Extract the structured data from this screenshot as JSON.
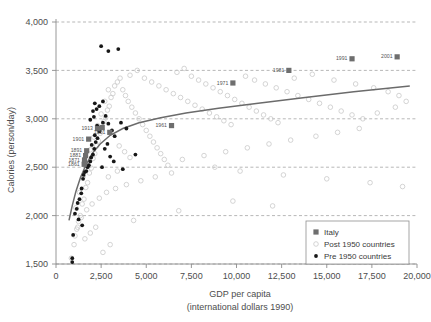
{
  "chart_data": {
    "type": "scatter",
    "title": "",
    "xlabel": "GDP per capita",
    "xlabel_sub": "(international dollars 1990)",
    "ylabel": "Calories (person/day)",
    "xlim": [
      0,
      20000
    ],
    "ylim": [
      1500,
      4000
    ],
    "xticks": [
      0,
      2500,
      5000,
      7500,
      10000,
      12500,
      15000,
      17500,
      20000
    ],
    "xtick_labels": [
      "0",
      "2,500",
      "5,000",
      "7,500",
      "10,000",
      "12,500",
      "15,000",
      "17,500",
      "20,000"
    ],
    "yticks": [
      1500,
      2000,
      2500,
      3000,
      3500,
      4000
    ],
    "ytick_labels": [
      "1,500",
      "2,000",
      "2,500",
      "3,000",
      "3,500",
      "4,000"
    ],
    "grid": true,
    "legend_position": "bottom-right",
    "legend": [
      {
        "label": "Italy",
        "marker": "square",
        "color": "#6e6e6e"
      },
      {
        "label": "Post 1950 countries",
        "marker": "circle-open",
        "color": "#c9c9c9"
      },
      {
        "label": "Pre 1950 countries",
        "marker": "dot",
        "color": "#171717"
      }
    ],
    "series": [
      {
        "name": "Italy",
        "marker": "square",
        "color": "#6e6e6e",
        "points": [
          {
            "x": 1560,
            "y": 2530,
            "label": "1861"
          },
          {
            "x": 1580,
            "y": 2575,
            "label": "1871"
          },
          {
            "x": 1640,
            "y": 2620,
            "label": "1881"
          },
          {
            "x": 1700,
            "y": 2670,
            "label": "1891"
          },
          {
            "x": 1810,
            "y": 2790,
            "label": "1901"
          },
          {
            "x": 2300,
            "y": 2900,
            "label": "1913"
          },
          {
            "x": 2560,
            "y": 2910,
            "label": ""
          },
          {
            "x": 2980,
            "y": 2860,
            "label": "1951"
          },
          {
            "x": 6400,
            "y": 2930,
            "label": "1961"
          },
          {
            "x": 9800,
            "y": 3370,
            "label": "1971"
          },
          {
            "x": 12900,
            "y": 3500,
            "label": "1981"
          },
          {
            "x": 16400,
            "y": 3620,
            "label": "1991"
          },
          {
            "x": 18900,
            "y": 3640,
            "label": "2001"
          }
        ]
      },
      {
        "name": "Pre 1950 countries",
        "marker": "dot",
        "color": "#171717",
        "points": [
          {
            "x": 900,
            "y": 1520
          },
          {
            "x": 900,
            "y": 1560
          },
          {
            "x": 950,
            "y": 1800
          },
          {
            "x": 1050,
            "y": 2020
          },
          {
            "x": 1150,
            "y": 2070
          },
          {
            "x": 1200,
            "y": 2130
          },
          {
            "x": 1300,
            "y": 2170
          },
          {
            "x": 1400,
            "y": 2230
          },
          {
            "x": 1420,
            "y": 2280
          },
          {
            "x": 1500,
            "y": 2380
          },
          {
            "x": 1530,
            "y": 2420
          },
          {
            "x": 1600,
            "y": 2450
          },
          {
            "x": 1680,
            "y": 2460
          },
          {
            "x": 1750,
            "y": 2500
          },
          {
            "x": 1820,
            "y": 2520
          },
          {
            "x": 1900,
            "y": 2560
          },
          {
            "x": 1950,
            "y": 2600
          },
          {
            "x": 2050,
            "y": 2630
          },
          {
            "x": 2120,
            "y": 2690
          },
          {
            "x": 1980,
            "y": 2730
          },
          {
            "x": 2200,
            "y": 2760
          },
          {
            "x": 2300,
            "y": 2800
          },
          {
            "x": 2150,
            "y": 2830
          },
          {
            "x": 2400,
            "y": 2870
          },
          {
            "x": 2500,
            "y": 2900
          },
          {
            "x": 2280,
            "y": 2930
          },
          {
            "x": 2600,
            "y": 2960
          },
          {
            "x": 1900,
            "y": 2990
          },
          {
            "x": 2100,
            "y": 3020
          },
          {
            "x": 2050,
            "y": 3080
          },
          {
            "x": 2250,
            "y": 3100
          },
          {
            "x": 2400,
            "y": 3130
          },
          {
            "x": 2150,
            "y": 3160
          },
          {
            "x": 2600,
            "y": 3180
          },
          {
            "x": 2750,
            "y": 3030
          },
          {
            "x": 2900,
            "y": 2950
          },
          {
            "x": 3100,
            "y": 2880
          },
          {
            "x": 3250,
            "y": 2820
          },
          {
            "x": 2850,
            "y": 2740
          },
          {
            "x": 2700,
            "y": 2690
          },
          {
            "x": 3000,
            "y": 2610
          },
          {
            "x": 3200,
            "y": 2560
          },
          {
            "x": 2550,
            "y": 2500
          },
          {
            "x": 2500,
            "y": 3750
          },
          {
            "x": 2900,
            "y": 3700
          },
          {
            "x": 3450,
            "y": 3720
          },
          {
            "x": 3600,
            "y": 2960
          },
          {
            "x": 3900,
            "y": 2900
          },
          {
            "x": 4400,
            "y": 2630
          },
          {
            "x": 1450,
            "y": 1900
          },
          {
            "x": 1250,
            "y": 1960
          },
          {
            "x": 3700,
            "y": 2480
          }
        ]
      },
      {
        "name": "Post 1950 countries",
        "marker": "circle-open",
        "color": "#c9c9c9",
        "points": [
          {
            "x": 850,
            "y": 1560
          },
          {
            "x": 1000,
            "y": 1700
          },
          {
            "x": 1050,
            "y": 1790
          },
          {
            "x": 1150,
            "y": 1860
          },
          {
            "x": 1250,
            "y": 1940
          },
          {
            "x": 1350,
            "y": 2000
          },
          {
            "x": 1100,
            "y": 2080
          },
          {
            "x": 1450,
            "y": 2120
          },
          {
            "x": 1550,
            "y": 2170
          },
          {
            "x": 1300,
            "y": 2240
          },
          {
            "x": 1650,
            "y": 2290
          },
          {
            "x": 1750,
            "y": 2340
          },
          {
            "x": 1500,
            "y": 2400
          },
          {
            "x": 1850,
            "y": 2440
          },
          {
            "x": 1950,
            "y": 2490
          },
          {
            "x": 1700,
            "y": 2540
          },
          {
            "x": 2050,
            "y": 2590
          },
          {
            "x": 2150,
            "y": 2640
          },
          {
            "x": 1900,
            "y": 2680
          },
          {
            "x": 2250,
            "y": 2720
          },
          {
            "x": 2350,
            "y": 2770
          },
          {
            "x": 2100,
            "y": 2810
          },
          {
            "x": 2450,
            "y": 2850
          },
          {
            "x": 2550,
            "y": 2890
          },
          {
            "x": 2300,
            "y": 2930
          },
          {
            "x": 2650,
            "y": 2970
          },
          {
            "x": 2750,
            "y": 3010
          },
          {
            "x": 2500,
            "y": 3050
          },
          {
            "x": 2850,
            "y": 3090
          },
          {
            "x": 2950,
            "y": 3130
          },
          {
            "x": 2700,
            "y": 3180
          },
          {
            "x": 3050,
            "y": 3220
          },
          {
            "x": 3150,
            "y": 3260
          },
          {
            "x": 2900,
            "y": 3300
          },
          {
            "x": 3250,
            "y": 3340
          },
          {
            "x": 3400,
            "y": 3380
          },
          {
            "x": 3550,
            "y": 3420
          },
          {
            "x": 3700,
            "y": 3300
          },
          {
            "x": 3850,
            "y": 3240
          },
          {
            "x": 4000,
            "y": 3180
          },
          {
            "x": 4200,
            "y": 3120
          },
          {
            "x": 4400,
            "y": 3060
          },
          {
            "x": 4600,
            "y": 3000
          },
          {
            "x": 4800,
            "y": 2940
          },
          {
            "x": 5000,
            "y": 2880
          },
          {
            "x": 5200,
            "y": 2820
          },
          {
            "x": 5400,
            "y": 2760
          },
          {
            "x": 5600,
            "y": 2700
          },
          {
            "x": 5800,
            "y": 2640
          },
          {
            "x": 6000,
            "y": 2580
          },
          {
            "x": 6200,
            "y": 2520
          },
          {
            "x": 4100,
            "y": 3450
          },
          {
            "x": 4500,
            "y": 3500
          },
          {
            "x": 4900,
            "y": 3420
          },
          {
            "x": 5300,
            "y": 3380
          },
          {
            "x": 5700,
            "y": 3340
          },
          {
            "x": 6100,
            "y": 3300
          },
          {
            "x": 6500,
            "y": 3260
          },
          {
            "x": 6900,
            "y": 3220
          },
          {
            "x": 7300,
            "y": 3180
          },
          {
            "x": 7700,
            "y": 3140
          },
          {
            "x": 8100,
            "y": 3100
          },
          {
            "x": 8500,
            "y": 3060
          },
          {
            "x": 8900,
            "y": 3020
          },
          {
            "x": 9300,
            "y": 2980
          },
          {
            "x": 9700,
            "y": 2940
          },
          {
            "x": 6700,
            "y": 3480
          },
          {
            "x": 7100,
            "y": 3520
          },
          {
            "x": 7500,
            "y": 3440
          },
          {
            "x": 7900,
            "y": 3400
          },
          {
            "x": 8300,
            "y": 3360
          },
          {
            "x": 8700,
            "y": 3320
          },
          {
            "x": 9100,
            "y": 3280
          },
          {
            "x": 9500,
            "y": 3240
          },
          {
            "x": 9900,
            "y": 3200
          },
          {
            "x": 10300,
            "y": 3160
          },
          {
            "x": 10700,
            "y": 3120
          },
          {
            "x": 11100,
            "y": 3080
          },
          {
            "x": 11500,
            "y": 3040
          },
          {
            "x": 11900,
            "y": 3000
          },
          {
            "x": 12300,
            "y": 2960
          },
          {
            "x": 10500,
            "y": 3440
          },
          {
            "x": 11000,
            "y": 3400
          },
          {
            "x": 11600,
            "y": 3360
          },
          {
            "x": 12200,
            "y": 3320
          },
          {
            "x": 12800,
            "y": 3280
          },
          {
            "x": 13400,
            "y": 3240
          },
          {
            "x": 14000,
            "y": 3200
          },
          {
            "x": 14600,
            "y": 3160
          },
          {
            "x": 15200,
            "y": 3120
          },
          {
            "x": 15800,
            "y": 3080
          },
          {
            "x": 16400,
            "y": 3040
          },
          {
            "x": 17000,
            "y": 3000
          },
          {
            "x": 13200,
            "y": 3420
          },
          {
            "x": 14200,
            "y": 3460
          },
          {
            "x": 15400,
            "y": 3400
          },
          {
            "x": 16600,
            "y": 3360
          },
          {
            "x": 17600,
            "y": 3320
          },
          {
            "x": 18400,
            "y": 3280
          },
          {
            "x": 19000,
            "y": 3240
          },
          {
            "x": 19400,
            "y": 3180
          },
          {
            "x": 18800,
            "y": 3120
          },
          {
            "x": 17800,
            "y": 3060
          },
          {
            "x": 16800,
            "y": 2900
          },
          {
            "x": 15600,
            "y": 2860
          },
          {
            "x": 14400,
            "y": 2820
          },
          {
            "x": 13000,
            "y": 2780
          },
          {
            "x": 11800,
            "y": 2740
          },
          {
            "x": 10600,
            "y": 2700
          },
          {
            "x": 9400,
            "y": 2660
          },
          {
            "x": 8200,
            "y": 2620
          },
          {
            "x": 7000,
            "y": 2580
          },
          {
            "x": 6400,
            "y": 2440
          },
          {
            "x": 5500,
            "y": 2400
          },
          {
            "x": 4700,
            "y": 2360
          },
          {
            "x": 3900,
            "y": 2320
          },
          {
            "x": 3300,
            "y": 2280
          },
          {
            "x": 2800,
            "y": 2240
          },
          {
            "x": 2400,
            "y": 2180
          },
          {
            "x": 2000,
            "y": 2120
          },
          {
            "x": 1700,
            "y": 2060
          },
          {
            "x": 1400,
            "y": 1980
          },
          {
            "x": 1200,
            "y": 1880
          },
          {
            "x": 1600,
            "y": 1760
          },
          {
            "x": 1900,
            "y": 1820
          },
          {
            "x": 2200,
            "y": 1880
          },
          {
            "x": 8800,
            "y": 2500
          },
          {
            "x": 10200,
            "y": 2460
          },
          {
            "x": 12600,
            "y": 2420
          },
          {
            "x": 15000,
            "y": 2380
          },
          {
            "x": 17400,
            "y": 2340
          },
          {
            "x": 19200,
            "y": 2300
          },
          {
            "x": 9800,
            "y": 2150
          },
          {
            "x": 12000,
            "y": 2100
          },
          {
            "x": 6800,
            "y": 2050
          },
          {
            "x": 4300,
            "y": 1950
          },
          {
            "x": 3000,
            "y": 1700
          },
          {
            "x": 2600,
            "y": 1620
          },
          {
            "x": 3500,
            "y": 2720
          },
          {
            "x": 3800,
            "y": 2660
          },
          {
            "x": 4100,
            "y": 2600
          },
          {
            "x": 2900,
            "y": 2400
          },
          {
            "x": 3400,
            "y": 2460
          }
        ]
      }
    ],
    "trend_line": {
      "name": "fitted trend",
      "points": [
        {
          "x": 720,
          "y": 1950
        },
        {
          "x": 900,
          "y": 2100
        },
        {
          "x": 1100,
          "y": 2250
        },
        {
          "x": 1350,
          "y": 2390
        },
        {
          "x": 1650,
          "y": 2520
        },
        {
          "x": 2000,
          "y": 2640
        },
        {
          "x": 2450,
          "y": 2740
        },
        {
          "x": 3000,
          "y": 2830
        },
        {
          "x": 3700,
          "y": 2900
        },
        {
          "x": 4600,
          "y": 2960
        },
        {
          "x": 5800,
          "y": 3010
        },
        {
          "x": 7200,
          "y": 3060
        },
        {
          "x": 9000,
          "y": 3110
        },
        {
          "x": 11200,
          "y": 3160
        },
        {
          "x": 13800,
          "y": 3220
        },
        {
          "x": 16500,
          "y": 3280
        },
        {
          "x": 19600,
          "y": 3340
        }
      ]
    }
  }
}
